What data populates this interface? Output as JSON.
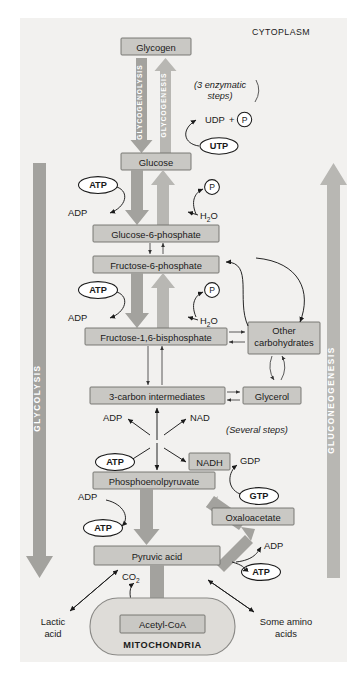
{
  "figure": {
    "compartments": {
      "cytoplasm": "CYTOPLASM",
      "mitochondria": "MITOCHONDRIA"
    },
    "pathway_arrows": [
      {
        "name": "glycolysis",
        "label": "GLYCOLYSIS",
        "direction": "down"
      },
      {
        "name": "gluconeogenesis",
        "label": "GLUCONEOGENESIS",
        "direction": "up"
      },
      {
        "name": "glycogenolysis",
        "label": "GLYCOGENOLYSIS",
        "direction": "down"
      },
      {
        "name": "glycogenesis",
        "label": "GLYCOGENESIS",
        "direction": "up"
      }
    ],
    "metabolites": [
      {
        "id": "glycogen",
        "label": "Glycogen"
      },
      {
        "id": "glucose",
        "label": "Glucose"
      },
      {
        "id": "g6p",
        "label": "Glucose-6-phosphate"
      },
      {
        "id": "f6p",
        "label": "Fructose-6-phosphate"
      },
      {
        "id": "f16bp",
        "label": "Fructose-1,6-bisphosphate"
      },
      {
        "id": "three_carbon",
        "label": "3-carbon intermediates"
      },
      {
        "id": "pep",
        "label": "Phosphoenolpyruvate"
      },
      {
        "id": "pyruvate",
        "label": "Pyruvic acid"
      },
      {
        "id": "acetyl_coa",
        "label": "Acetyl-CoA"
      },
      {
        "id": "other_carbs",
        "label_line1": "Other",
        "label_line2": "carbohydrates"
      },
      {
        "id": "glycerol",
        "label": "Glycerol"
      },
      {
        "id": "nadh",
        "label": "NADH"
      },
      {
        "id": "oxaloacetate",
        "label": "Oxaloacetate"
      }
    ],
    "cofactors": [
      {
        "id": "atp_1",
        "label": "ATP"
      },
      {
        "id": "atp_2",
        "label": "ATP"
      },
      {
        "id": "atp_3",
        "label": "ATP"
      },
      {
        "id": "atp_4",
        "label": "ATP"
      },
      {
        "id": "atp_5",
        "label": "ATP"
      },
      {
        "id": "utp",
        "label": "UTP"
      },
      {
        "id": "gtp",
        "label": "GTP"
      }
    ],
    "small_molecules": [
      {
        "id": "adp_1",
        "label": "ADP"
      },
      {
        "id": "adp_2",
        "label": "ADP"
      },
      {
        "id": "adp_3",
        "label": "ADP"
      },
      {
        "id": "adp_4",
        "label": "ADP"
      },
      {
        "id": "adp_5",
        "label": "ADP"
      },
      {
        "id": "nad",
        "label": "NAD"
      },
      {
        "id": "udp",
        "label": "UDP"
      },
      {
        "id": "plus",
        "label": "+"
      },
      {
        "id": "phosphate_1",
        "label": "P"
      },
      {
        "id": "phosphate_2",
        "label": "P"
      },
      {
        "id": "phosphate_3",
        "label": "P"
      },
      {
        "id": "phosphate_4",
        "label": "P"
      },
      {
        "id": "gdp",
        "label": "GDP"
      }
    ],
    "water_labels": [
      {
        "id": "h2o_1",
        "main": "H",
        "sub": "2",
        "tail": "O"
      },
      {
        "id": "h2o_2",
        "main": "H",
        "sub": "2",
        "tail": "O"
      }
    ],
    "co2": {
      "main": "CO",
      "sub": "2"
    },
    "annotations": [
      {
        "id": "three_enzymatic",
        "line1": "(3 enzymatic",
        "line2": "steps)"
      },
      {
        "id": "several_steps",
        "text": "(Several steps)"
      }
    ],
    "endpoints": [
      {
        "id": "lactic_acid",
        "line1": "Lactic",
        "line2": "acid"
      },
      {
        "id": "some_amino_acids",
        "line1": "Some amino",
        "line2": "acids"
      }
    ],
    "colors": {
      "background": "#f2f1ef",
      "box_fill": "#c9c8c4",
      "box_stroke": "#6e6d6a",
      "fat_arrow": "#a3a29e",
      "fat_arrow_light": "#b8b7b3",
      "mitochondria_fill": "#dedcd8",
      "text": "#1a1a1a"
    }
  }
}
